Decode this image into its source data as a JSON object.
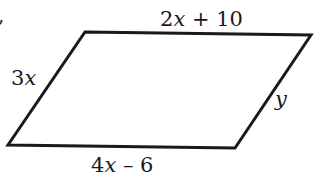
{
  "figure": {
    "type": "parallelogram",
    "stroke_color": "#1a1a1a",
    "background": "#ffffff",
    "vertices": {
      "top_left": [
        85,
        32
      ],
      "top_right": [
        311,
        35
      ],
      "bottom_right": [
        235,
        148
      ],
      "bottom_left": [
        8,
        145
      ]
    },
    "sides": {
      "top": {
        "coef": "2",
        "var": "x",
        "rest": " + 10",
        "full": "2x + 10"
      },
      "left": {
        "coef": "3",
        "var": "x",
        "rest": "",
        "full": "3x"
      },
      "right": {
        "coef": "",
        "var": "y",
        "rest": "",
        "full": "y"
      },
      "bottom": {
        "coef": "4",
        "var": "x",
        "rest": " – 6",
        "full": "4x – 6"
      }
    },
    "fragment": ","
  }
}
